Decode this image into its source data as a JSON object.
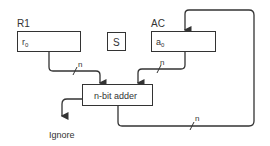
{
  "registers": {
    "r1": {
      "label": "R1",
      "content": "r",
      "sub": "0"
    },
    "s": {
      "label": "S"
    },
    "ac": {
      "label": "AC",
      "content": "a",
      "sub": "0"
    }
  },
  "adder": {
    "label": "n-bit adder"
  },
  "outputs": {
    "ignore": "Ignore"
  },
  "bus_labels": {
    "r1_to_adder": "n",
    "ac_to_adder": "n",
    "feedback": "n"
  }
}
